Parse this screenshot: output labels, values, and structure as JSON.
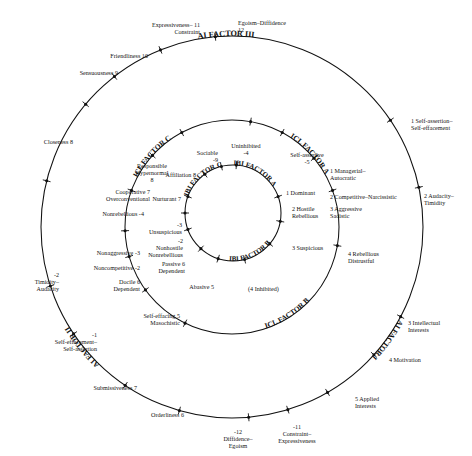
{
  "figure": {
    "rings": [
      {
        "id": "outer",
        "arc_labels": [
          "AI FACTOR III",
          "AI FACTOR I",
          "AI FACTOR II"
        ]
      },
      {
        "id": "middle",
        "arc_labels": [
          "ICL FACTOR A",
          "ICL FACTOR B",
          "ICL FACTOR C"
        ]
      },
      {
        "id": "inner",
        "arc_labels": [
          "IBI FACTOR A",
          "IBI FACTOR B",
          "IBI FACTOR C"
        ]
      }
    ]
  },
  "chart_data": {
    "type": "scatter",
    "xlabel": "",
    "ylabel": "",
    "rings": [
      {
        "name": "outer",
        "radius": 191,
        "arc_labels": [
          "AI FACTOR III",
          "AI FACTOR I",
          "AI FACTOR II"
        ],
        "points": [
          {
            "num": "12",
            "label": "Egoism–Diffidence",
            "angle_deg": 95
          },
          {
            "num": "11",
            "label": "Expressiveness–\nConstraint",
            "angle_deg": 112
          },
          {
            "num": "10",
            "label": "Friendliness",
            "angle_deg": 128
          },
          {
            "num": "9",
            "label": "Sensuousness",
            "angle_deg": 140
          },
          {
            "num": "8",
            "label": "Closeness",
            "angle_deg": 166
          },
          {
            "num": "-2",
            "label": "Timidity–\nAudacity",
            "angle_deg": 198
          },
          {
            "num": "-1",
            "label": "Self-effacement–\nSelf-assertion",
            "angle_deg": 214
          },
          {
            "num": "7",
            "label": "Submissiveness",
            "angle_deg": 236
          },
          {
            "num": "6",
            "label": "Orderliness",
            "angle_deg": 254
          },
          {
            "num": "-12",
            "label": "Diffidence–\nEgoism",
            "angle_deg": 275
          },
          {
            "num": "-11",
            "label": "Constraint–\nExpressiveness",
            "angle_deg": 287
          },
          {
            "num": "5",
            "label": "Applied\nInterests",
            "angle_deg": 300
          },
          {
            "num": "4",
            "label": "Motivation",
            "angle_deg": 318
          },
          {
            "num": "3",
            "label": "Intellectual\nInterests",
            "angle_deg": 332
          },
          {
            "num": "2",
            "label": "Audacity–\nTimidity",
            "angle_deg": 12
          },
          {
            "num": "1",
            "label": "Self-assertion–\nSelf-effacement",
            "angle_deg": 34
          }
        ]
      },
      {
        "name": "middle",
        "radius": 107,
        "arc_labels": [
          "ICL FACTOR A",
          "ICL FACTOR B",
          "ICL FACTOR C"
        ],
        "points": [
          {
            "num": "-5",
            "label": "Self-assertive",
            "angle_deg": 80
          },
          {
            "num": "1",
            "label": "Managerial–\nAutocratic",
            "angle_deg": 62
          },
          {
            "num": "2",
            "label": "Competitive–Narcissistic",
            "angle_deg": 40
          },
          {
            "num": "3",
            "label": "Aggressive\nSadistic",
            "angle_deg": 20
          },
          {
            "num": "4",
            "label": "Rebellious\nDistrustful",
            "angle_deg": 350
          },
          {
            "num": "5",
            "label": "Self-effacing\nMasochistic",
            "angle_deg": 244
          },
          {
            "num": "6",
            "label": "Docile\nDependent",
            "angle_deg": 216
          },
          {
            "num": "-2",
            "label": "Noncompetitive",
            "angle_deg": 196
          },
          {
            "num": "-3",
            "label": "Nonaggressive",
            "angle_deg": 182
          },
          {
            "num": "-4",
            "label": "Nonrebellious",
            "angle_deg": 160
          },
          {
            "num": "7",
            "label": "Cooperative\nOverconventional",
            "angle_deg": 138
          },
          {
            "num": "8",
            "label": "Responsible\nHypernormal",
            "angle_deg": 118
          }
        ]
      },
      {
        "name": "inner",
        "radius": 48,
        "arc_labels": [
          "IBI FACTOR A",
          "IBI FACTOR B",
          "IBI FACTOR C"
        ],
        "points": [
          {
            "num": "-4",
            "label": "Uninhibited",
            "angle_deg": 86
          },
          {
            "num": "-9",
            "label": "Sociable",
            "angle_deg": 104
          },
          {
            "num": "8",
            "label": "Affiliation",
            "angle_deg": 126
          },
          {
            "num": "7",
            "label": "Nurturant",
            "angle_deg": 160
          },
          {
            "num": "-3",
            "label": "Unsuspicious",
            "angle_deg": 180
          },
          {
            "num": "-2",
            "label": "Nonhostile\nNonrebellious",
            "angle_deg": 200
          },
          {
            "num": "6",
            "label": "Passive\nDependent",
            "angle_deg": 228
          },
          {
            "num": "5",
            "label": "Abasive",
            "angle_deg": 252
          },
          {
            "num": "4",
            "label": "(4 Inhibited)",
            "angle_deg": 284
          },
          {
            "num": "3",
            "label": "Suspicious",
            "angle_deg": 320
          },
          {
            "num": "2",
            "label": "Hostile\nRebellious",
            "angle_deg": 350
          },
          {
            "num": "1",
            "label": "Dominant",
            "angle_deg": 20
          }
        ]
      }
    ]
  },
  "labels": {
    "outer": [
      {
        "id": "egoism-diffidence",
        "num": "12",
        "text": "Egoism–Diffidence",
        "x": 238,
        "y": 20,
        "align": "left",
        "numpos": "below-left"
      },
      {
        "id": "expressiveness-constraint",
        "num": "11",
        "text": "Expressiveness–\nConstraint",
        "x": 200,
        "y": 22,
        "align": "right",
        "numpos": "inline"
      },
      {
        "id": "friendliness",
        "num": "10",
        "text": "Friendliness",
        "x": 148,
        "y": 53,
        "align": "right",
        "numpos": "inline"
      },
      {
        "id": "sensuousness",
        "num": "9",
        "text": "Sensuousness",
        "x": 118,
        "y": 70,
        "align": "right",
        "numpos": "inline"
      },
      {
        "id": "closeness",
        "num": "8",
        "text": "Closeness",
        "x": 73,
        "y": 139,
        "align": "right",
        "numpos": "inline"
      },
      {
        "id": "timidity-audacity",
        "num": "-2",
        "text": "Timidity–\nAudacity",
        "x": 59,
        "y": 272,
        "align": "right",
        "numpos": "above"
      },
      {
        "id": "self-effacement-self-assertion",
        "num": "-1",
        "text": "Self-effacement–\nSelf-assertion",
        "x": 97,
        "y": 332,
        "align": "right",
        "numpos": "above"
      },
      {
        "id": "submissiveness",
        "num": "7",
        "text": "Submissiveness",
        "x": 137,
        "y": 385,
        "align": "right",
        "numpos": "inline"
      },
      {
        "id": "orderliness",
        "num": "6",
        "text": "Orderliness",
        "x": 184,
        "y": 412,
        "align": "right",
        "numpos": "inline"
      },
      {
        "id": "diffidence-egoism",
        "num": "-12",
        "text": "Diffidence–\nEgoism",
        "x": 238,
        "y": 429,
        "align": "center",
        "numpos": "above"
      },
      {
        "id": "constraint-expressiveness",
        "num": "-11",
        "text": "Constraint–\nExpressiveness",
        "x": 297,
        "y": 424,
        "align": "center",
        "numpos": "above"
      },
      {
        "id": "applied-interests",
        "num": "5",
        "text": "Applied\nInterests",
        "x": 355,
        "y": 396,
        "align": "left",
        "numpos": "inline"
      },
      {
        "id": "motivation",
        "num": "4",
        "text": "Motivation",
        "x": 389,
        "y": 357,
        "align": "left",
        "numpos": "inline"
      },
      {
        "id": "intellectual-interests",
        "num": "3",
        "text": "Intellectual\nInterests",
        "x": 408,
        "y": 320,
        "align": "left",
        "numpos": "inline"
      },
      {
        "id": "audacity-timidity",
        "num": "2",
        "text": "Audacity–\nTimidity",
        "x": 424,
        "y": 193,
        "align": "left",
        "numpos": "inline"
      },
      {
        "id": "self-assertion-self-effacement",
        "num": "1",
        "text": "Self-assertion–\nSelf-effacement",
        "x": 411,
        "y": 118,
        "align": "left",
        "numpos": "inline"
      }
    ],
    "middle": [
      {
        "id": "self-assertive",
        "num": "-5",
        "text": "Self-assertive",
        "x": 307,
        "y": 152,
        "align": "center",
        "numpos": "below"
      },
      {
        "id": "managerial-autocratic",
        "num": "1",
        "text": "Managerial–\nAutocratic",
        "x": 330,
        "y": 168,
        "align": "left",
        "numpos": "second-line"
      },
      {
        "id": "competitive-narcissistic",
        "num": "2",
        "text": "Competitive–Narcissistic",
        "x": 330,
        "y": 194,
        "align": "left",
        "numpos": "inline"
      },
      {
        "id": "aggressive-sadistic",
        "num": "3",
        "text": "Aggressive\nSadistic",
        "x": 330,
        "y": 206,
        "align": "left",
        "numpos": "inline"
      },
      {
        "id": "rebellious-distrustful",
        "num": "4",
        "text": "Rebellious\nDistrustful",
        "x": 348,
        "y": 251,
        "align": "left",
        "numpos": "inline"
      },
      {
        "id": "self-effacing-masochistic",
        "num": "5",
        "text": "Self-effacing\nMasochistic",
        "x": 180,
        "y": 313,
        "align": "right",
        "numpos": "inline-after"
      },
      {
        "id": "docile-dependent",
        "num": "6",
        "text": "Docile\nDependent",
        "x": 140,
        "y": 279,
        "align": "right",
        "numpos": "inline-after"
      },
      {
        "id": "noncompetitive",
        "num": "-2",
        "text": "Noncompetitive",
        "x": 140,
        "y": 265,
        "align": "right",
        "numpos": "inline"
      },
      {
        "id": "nonaggressive",
        "num": "-3",
        "text": "Nonaggressive",
        "x": 140,
        "y": 250,
        "align": "right",
        "numpos": "inline"
      },
      {
        "id": "nonrebellious",
        "num": "-4",
        "text": "Nonrebellious",
        "x": 144,
        "y": 211,
        "align": "right",
        "numpos": "inline"
      },
      {
        "id": "cooperative-overconventional",
        "num": "7",
        "text": "Cooperative\nOverconventional",
        "x": 150,
        "y": 189,
        "align": "right",
        "numpos": "inline-after"
      },
      {
        "id": "responsible-hypernormal",
        "num": "8",
        "text": "Responsible\nHypernormal",
        "x": 152,
        "y": 163,
        "align": "center",
        "numpos": "below"
      }
    ],
    "inner": [
      {
        "id": "uninhibited",
        "num": "-4",
        "text": "Uninhibited",
        "x": 246,
        "y": 143,
        "align": "center",
        "numpos": "below"
      },
      {
        "id": "sociable",
        "num": "-9",
        "text": "Sociable",
        "x": 218,
        "y": 150,
        "align": "right",
        "numpos": "below"
      },
      {
        "id": "affiliation",
        "num": "8",
        "text": "Affiliation",
        "x": 196,
        "y": 172,
        "align": "right",
        "numpos": "inline"
      },
      {
        "id": "nurturant",
        "num": "7",
        "text": "Nurturant",
        "x": 181,
        "y": 196,
        "align": "right",
        "numpos": "inline"
      },
      {
        "id": "unsuspicious",
        "num": "-3",
        "text": "Unsuspicious",
        "x": 182,
        "y": 222,
        "align": "right",
        "numpos": "above"
      },
      {
        "id": "nonhostile-nonrebellious",
        "num": "-2",
        "text": "Nonhostile\nNonrebellious",
        "x": 183,
        "y": 238,
        "align": "right",
        "numpos": "above"
      },
      {
        "id": "passive-dependent",
        "num": "6",
        "text": "Passive\nDependent",
        "x": 185,
        "y": 261,
        "align": "right",
        "numpos": "inline-after"
      },
      {
        "id": "abasive",
        "num": "5",
        "text": "Abasive",
        "x": 214,
        "y": 284,
        "align": "right",
        "numpos": "inline-after"
      },
      {
        "id": "inhibited",
        "num": "",
        "text": "(4 Inhibited)",
        "x": 248,
        "y": 286,
        "align": "left",
        "numpos": "none"
      },
      {
        "id": "suspicious",
        "num": "3",
        "text": "Suspicious",
        "x": 292,
        "y": 245,
        "align": "left",
        "numpos": "inline"
      },
      {
        "id": "hostile-rebellious",
        "num": "2",
        "text": "Hostile\nRebellious",
        "x": 292,
        "y": 206,
        "align": "left",
        "numpos": "inline"
      },
      {
        "id": "dominant",
        "num": "1",
        "text": "Dominant",
        "x": 286,
        "y": 190,
        "align": "left",
        "numpos": "inline"
      }
    ]
  },
  "arcs": {
    "ai_factor_3": "AI FACTOR III",
    "ai_factor_1": "AI FACTOR I",
    "ai_factor_2": "AI FACTOR II",
    "icl_factor_a": "ICL FACTOR A",
    "icl_factor_b": "ICL FACTOR B",
    "icl_factor_c": "ICL FACTOR C",
    "ibi_factor_a": "IBI FACTOR A",
    "ibi_factor_b": "IBI FACTOR B",
    "ibi_factor_c": "IBI FACTOR C"
  },
  "colors": {
    "stroke": "#111111",
    "background": "#ffffff"
  }
}
